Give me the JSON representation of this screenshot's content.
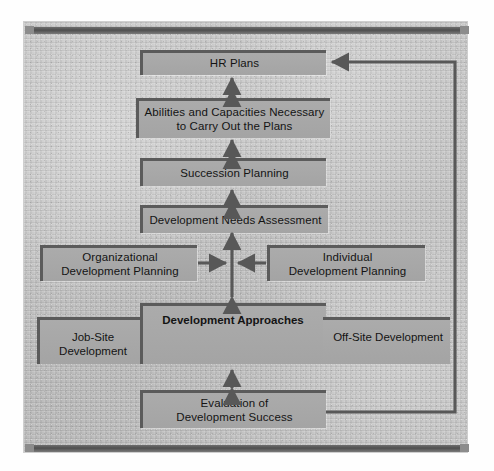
{
  "diagram": {
    "type": "flowchart",
    "palette": {
      "background": "#bfbfbf",
      "box_fill": "#a8a8a8",
      "box_border": "#5b5b5b",
      "arrow": "#585858",
      "rail": "#575757",
      "text": "#141414"
    },
    "nodes": [
      {
        "id": "hr-plans",
        "label": "HR Plans",
        "emphasis": "normal"
      },
      {
        "id": "abilities",
        "label": "Abilities and Capacities Necessary\nto Carry Out the Plans",
        "line1": "Abilities and Capacities Necessary",
        "line2": "to Carry Out the Plans",
        "emphasis": "normal"
      },
      {
        "id": "succession",
        "label": "Succession Planning",
        "emphasis": "normal"
      },
      {
        "id": "needs-assessment",
        "label": "Development Needs Assessment",
        "emphasis": "normal"
      },
      {
        "id": "org-planning",
        "line1": "Organizational",
        "line2": "Development Planning",
        "emphasis": "normal"
      },
      {
        "id": "individual-planning",
        "line1": "Individual",
        "line2": "Development Planning",
        "emphasis": "normal"
      },
      {
        "id": "job-site",
        "line1": "Job-Site",
        "line2": "Development",
        "emphasis": "normal"
      },
      {
        "id": "approaches",
        "line1": "Development",
        "line2": "Approaches",
        "emphasis": "bold"
      },
      {
        "id": "off-site",
        "line1": "Off-Site",
        "line2": "Development",
        "emphasis": "normal"
      },
      {
        "id": "evaluation",
        "line1": "Evaluation of",
        "line2": "Development Success",
        "emphasis": "normal"
      }
    ],
    "edges": [
      {
        "from": "abilities",
        "to": "hr-plans",
        "style": "double-arrow",
        "orientation": "vertical"
      },
      {
        "from": "succession",
        "to": "abilities",
        "style": "double-arrow",
        "orientation": "vertical"
      },
      {
        "from": "needs-assessment",
        "to": "succession",
        "style": "double-arrow",
        "orientation": "vertical"
      },
      {
        "from": "needs-assessment",
        "to": "approaches",
        "style": "double-arrow",
        "orientation": "vertical"
      },
      {
        "from": "org-planning",
        "to": "approaches-stem",
        "style": "arrow",
        "orientation": "horizontal-right"
      },
      {
        "from": "individual-planning",
        "to": "approaches-stem",
        "style": "arrow",
        "orientation": "horizontal-left"
      },
      {
        "from": "approaches",
        "to": "evaluation",
        "style": "double-arrow",
        "orientation": "vertical"
      },
      {
        "from": "evaluation",
        "to": "hr-plans",
        "style": "feedback-loop",
        "orientation": "right-side"
      }
    ]
  }
}
